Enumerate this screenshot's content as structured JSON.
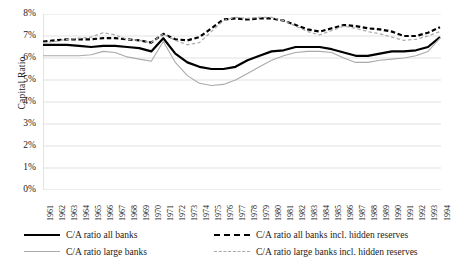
{
  "chart_data": {
    "type": "line",
    "title": "",
    "xlabel": "",
    "ylabel": "Capital Ratio",
    "ylim": [
      0,
      0.08
    ],
    "ytick_labels": [
      "0%",
      "1%",
      "2%",
      "3%",
      "4%",
      "5%",
      "6%",
      "7%",
      "8%"
    ],
    "ytick_values": [
      0,
      1,
      2,
      3,
      4,
      5,
      6,
      7,
      8
    ],
    "grid": "horizontal",
    "legend_position": "bottom",
    "x": [
      1961,
      1962,
      1963,
      1964,
      1965,
      1966,
      1967,
      1968,
      1969,
      1970,
      1971,
      1972,
      1973,
      1974,
      1975,
      1976,
      1977,
      1978,
      1979,
      1980,
      1981,
      1982,
      1983,
      1984,
      1985,
      1986,
      1987,
      1988,
      1989,
      1990,
      1991,
      1992,
      1993,
      1994
    ],
    "categories": [
      "1961",
      "1962",
      "1963",
      "1964",
      "1965",
      "1966",
      "1967",
      "1968",
      "1969",
      "1970",
      "1971",
      "1972",
      "1973",
      "1974",
      "1975",
      "1976",
      "1977",
      "1978",
      "1979",
      "1980",
      "1981",
      "1982",
      "1983",
      "1984",
      "1985",
      "1986",
      "1987",
      "1988",
      "1989",
      "1990",
      "1991",
      "1992",
      "1993",
      "1994"
    ],
    "series": [
      {
        "name": "C/A ratio all banks",
        "style": "solid",
        "color": "#000000",
        "width": 2.2,
        "values": [
          6.6,
          6.6,
          6.6,
          6.55,
          6.5,
          6.55,
          6.55,
          6.5,
          6.45,
          6.3,
          6.9,
          6.2,
          5.8,
          5.6,
          5.5,
          5.5,
          5.6,
          5.9,
          6.1,
          6.3,
          6.35,
          6.5,
          6.5,
          6.5,
          6.4,
          6.25,
          6.1,
          6.1,
          6.2,
          6.3,
          6.3,
          6.35,
          6.5,
          6.95
        ]
      },
      {
        "name": "C/A ratio large banks",
        "style": "solid",
        "color": "#aaaaaa",
        "width": 1.1,
        "values": [
          6.1,
          6.1,
          6.1,
          6.1,
          6.15,
          6.3,
          6.25,
          6.05,
          5.95,
          5.85,
          6.75,
          5.8,
          5.2,
          4.85,
          4.75,
          4.8,
          5.0,
          5.3,
          5.6,
          5.9,
          6.1,
          6.25,
          6.3,
          6.3,
          6.25,
          6.0,
          5.8,
          5.8,
          5.9,
          5.95,
          6.0,
          6.1,
          6.3,
          6.9
        ]
      },
      {
        "name": "C/A ratio all banks incl. hidden reserves",
        "style": "dashed",
        "color": "#000000",
        "width": 2.2,
        "values": [
          6.75,
          6.8,
          6.85,
          6.85,
          6.85,
          6.9,
          6.9,
          6.85,
          6.8,
          6.7,
          7.1,
          6.85,
          6.8,
          6.95,
          7.35,
          7.75,
          7.8,
          7.75,
          7.8,
          7.8,
          7.7,
          7.5,
          7.3,
          7.2,
          7.35,
          7.5,
          7.45,
          7.35,
          7.3,
          7.2,
          7.0,
          7.0,
          7.15,
          7.4
        ]
      },
      {
        "name": "C/A ratio large banks incl. hidden reserves",
        "style": "dashed",
        "color": "#a8a8a8",
        "width": 1.2,
        "values": [
          6.7,
          6.75,
          6.85,
          6.9,
          6.95,
          7.15,
          7.05,
          6.85,
          6.8,
          6.7,
          7.1,
          6.8,
          6.6,
          6.7,
          7.2,
          7.7,
          7.85,
          7.8,
          7.85,
          7.85,
          7.7,
          7.45,
          7.2,
          7.05,
          7.25,
          7.45,
          7.35,
          7.2,
          7.1,
          6.95,
          6.8,
          6.85,
          7.0,
          7.2
        ]
      }
    ]
  },
  "legend": {
    "items": [
      {
        "label": "C/A ratio all banks",
        "swatch": "solid-black"
      },
      {
        "label": "C/A ratio all banks incl. hidden reserves",
        "swatch": "dash-black"
      },
      {
        "label": "C/A ratio large banks",
        "swatch": "solid-gray"
      },
      {
        "label": "C/A ratio large banks incl. hidden reserves",
        "swatch": "dash-gray"
      }
    ]
  },
  "colors": {
    "all_banks": "#000000",
    "large_banks": "#aaaaaa",
    "grid": "#d9d9d9",
    "text": "#1a1a1a"
  }
}
